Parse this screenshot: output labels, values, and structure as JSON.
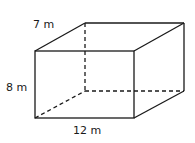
{
  "diagram": {
    "type": "rectangular-prism",
    "labels": {
      "depth": "7 m",
      "height": "8 m",
      "length": "12 m"
    },
    "colors": {
      "stroke": "#1a1a1a",
      "background": "#ffffff"
    }
  }
}
